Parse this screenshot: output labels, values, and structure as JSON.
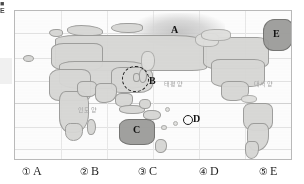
{
  "page": {
    "scan_mark_lines": [
      "■",
      "E"
    ],
    "equator_label": "0"
  },
  "map": {
    "title": "world-map",
    "ocean_labels": [
      {
        "name": "pacific-ocean",
        "text": "태평양",
        "x": 163,
        "y": 78
      },
      {
        "name": "atlantic-ocean",
        "text": "대서양",
        "x": 253,
        "y": 78
      },
      {
        "name": "indian-ocean",
        "text": "인도양",
        "x": 77,
        "y": 104
      }
    ],
    "markers": [
      {
        "id": "A",
        "label": "A",
        "kind": "haze-region",
        "region": "arctic-ocean",
        "x": 170,
        "y": 19
      },
      {
        "id": "B",
        "label": "B",
        "kind": "dashed-circle",
        "region": "korea-japan",
        "x": 133,
        "y": 62
      },
      {
        "id": "C",
        "label": "C",
        "kind": "shaded-landmass",
        "region": "australia",
        "x": 126,
        "y": 122
      },
      {
        "id": "D",
        "label": "D",
        "kind": "point-circle",
        "region": "south-pacific",
        "x": 178,
        "y": 103
      },
      {
        "id": "E",
        "label": "E",
        "kind": "shaded-landmass",
        "region": "greenland",
        "x": 272,
        "y": 23
      }
    ],
    "colors": {
      "land_fill": "#d8d8d6",
      "land_stroke": "#9b9b99",
      "highlight_fill": "#9d9d9b",
      "highlight_stroke": "#6f6f6d",
      "frame_border": "#b9b9b9",
      "graticule": "#e3e3e3",
      "marker_text": "#111111",
      "ocean_text": "#a6a6a6"
    }
  },
  "choices": [
    {
      "num": "①",
      "letter": "A"
    },
    {
      "num": "②",
      "letter": "B"
    },
    {
      "num": "③",
      "letter": "C"
    },
    {
      "num": "④",
      "letter": "D"
    },
    {
      "num": "⑤",
      "letter": "E"
    }
  ]
}
